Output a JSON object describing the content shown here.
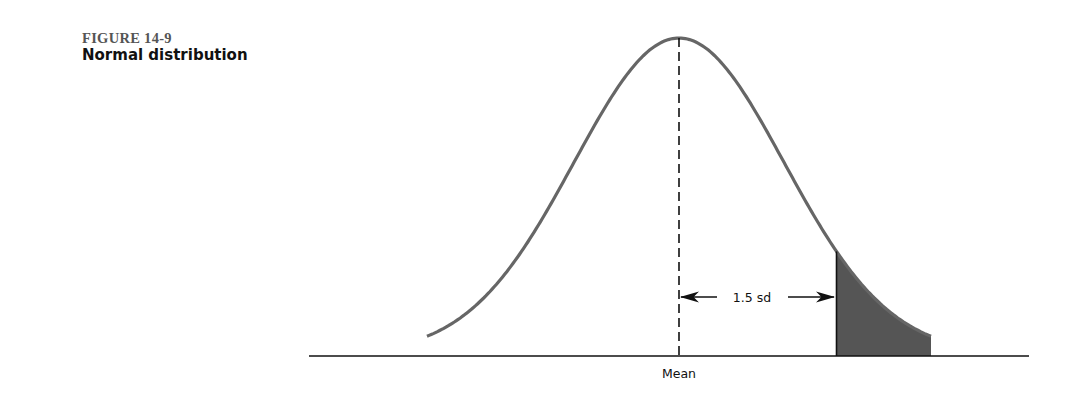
{
  "figure": {
    "number": "FIGURE 14-9",
    "title": "Normal distribution"
  },
  "chart_data": {
    "type": "area",
    "title": "Normal distribution",
    "xlabel": "",
    "ylabel": "",
    "x_tick_labels": [
      "Mean"
    ],
    "annotations": [
      {
        "text": "1.5 sd",
        "type": "double-arrow",
        "from_sd": 0,
        "to_sd": 1.5
      },
      {
        "text": "Mean",
        "type": "dashed-vertical-line",
        "at_sd": 0
      }
    ],
    "distribution": {
      "mean": 0,
      "sd": 1,
      "x_range_sd": [
        -2.4,
        2.4
      ]
    },
    "shaded_region": {
      "from_sd": 1.5,
      "to_sd": 2.4,
      "side": "right-tail",
      "color": "#555555"
    },
    "grid": false,
    "legend": null
  },
  "colors": {
    "curve": "#666666",
    "shade": "#555555",
    "axis": "#111111"
  }
}
